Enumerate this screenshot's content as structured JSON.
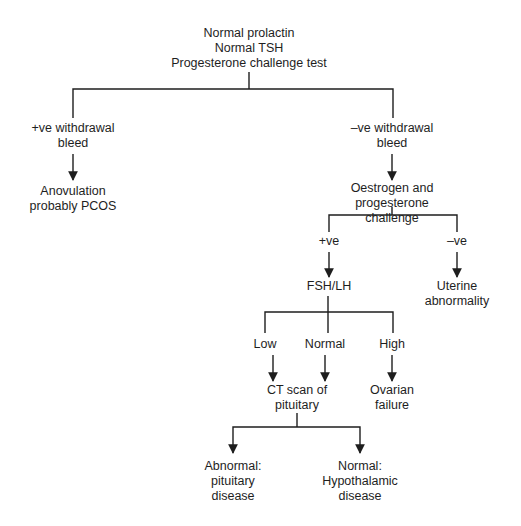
{
  "diagram": {
    "type": "flowchart",
    "nodes": {
      "root": {
        "lines": [
          "Normal prolactin",
          "Normal TSH",
          "Progesterone challenge test"
        ],
        "text": "Normal prolactin\nNormal TSH\nProgesterone challenge test"
      },
      "pos_withdrawal": {
        "text": "+ve withdrawal\nbleed"
      },
      "anovulation": {
        "text": "Anovulation\nprobably PCOS"
      },
      "neg_withdrawal": {
        "text": "–ve withdrawal\nbleed"
      },
      "oestrogen": {
        "text": "Oestrogen and\nprogesterone challenge"
      },
      "ep_pos": {
        "text": "+ve"
      },
      "ep_neg": {
        "text": "–ve"
      },
      "fsh_lh": {
        "text": "FSH/LH"
      },
      "uterine": {
        "text": "Uterine\nabnormality"
      },
      "low": {
        "text": "Low"
      },
      "normal": {
        "text": "Normal"
      },
      "high": {
        "text": "High"
      },
      "ct_scan": {
        "text": "CT scan of\npituitary"
      },
      "ovarian": {
        "text": "Ovarian\nfailure"
      },
      "pituitary_disease": {
        "text": "Abnormal:\npituitary\ndisease"
      },
      "hypothalamic": {
        "text": "Normal:\nHypothalamic\ndisease"
      }
    },
    "edges": [
      {
        "from": "root",
        "to": "pos_withdrawal",
        "arrow": false
      },
      {
        "from": "root",
        "to": "neg_withdrawal",
        "arrow": false
      },
      {
        "from": "pos_withdrawal",
        "to": "anovulation",
        "arrow": true
      },
      {
        "from": "neg_withdrawal",
        "to": "oestrogen",
        "arrow": true
      },
      {
        "from": "oestrogen",
        "to": "ep_pos",
        "arrow": false
      },
      {
        "from": "oestrogen",
        "to": "ep_neg",
        "arrow": false
      },
      {
        "from": "ep_pos",
        "to": "fsh_lh",
        "arrow": true
      },
      {
        "from": "ep_neg",
        "to": "uterine",
        "arrow": true
      },
      {
        "from": "fsh_lh",
        "to": "low",
        "arrow": false
      },
      {
        "from": "fsh_lh",
        "to": "normal",
        "arrow": false
      },
      {
        "from": "fsh_lh",
        "to": "high",
        "arrow": false
      },
      {
        "from": "low",
        "to": "ct_scan",
        "arrow": true
      },
      {
        "from": "normal",
        "to": "ct_scan",
        "arrow": true
      },
      {
        "from": "high",
        "to": "ovarian",
        "arrow": true
      },
      {
        "from": "ct_scan",
        "to": "pituitary_disease",
        "arrow": true
      },
      {
        "from": "ct_scan",
        "to": "hypothalamic",
        "arrow": true
      }
    ],
    "colors": {
      "line": "#1e1e1e",
      "text": "#1e1e1e",
      "background": "#ffffff"
    }
  }
}
